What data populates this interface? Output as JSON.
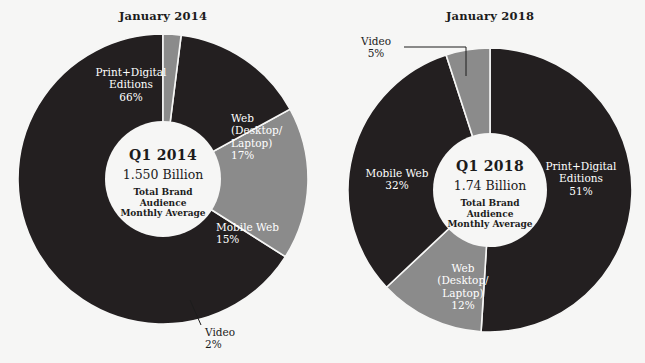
{
  "page": {
    "background_color": "#f6f6f5",
    "dark_color": "#231f20",
    "gray_color": "#8b8b8b",
    "hole_color": "#f6f6f5",
    "text_dark": "#1c1c1c",
    "text_light": "#ffffff"
  },
  "chart_data": [
    {
      "type": "pie",
      "title": "January 2014",
      "center": {
        "quarter": "Q1 2014",
        "value": "1.550 Billion",
        "subtitle": "Total Brand\nAudience\nMonthly Average"
      },
      "categories": [
        "Print+Digital Editions",
        "Web (Desktop/Laptop)",
        "Mobile Web",
        "Video"
      ],
      "values": [
        66,
        17,
        15,
        2
      ],
      "labels": [
        {
          "name": "Print+Digital\nEditions",
          "percent": "66%",
          "color": "#231f20",
          "text_color": "#ffffff"
        },
        {
          "name": "Web\n(Desktop/\nLaptop)",
          "percent": "17%",
          "color": "#8b8b8b",
          "text_color": "#ffffff"
        },
        {
          "name": "Mobile Web",
          "percent": "15%",
          "color": "#231f20",
          "text_color": "#ffffff"
        },
        {
          "name": "Video",
          "percent": "2%",
          "color": "#8b8b8b",
          "text_color": "#1c1c1c"
        }
      ],
      "legend": "none",
      "grid": false
    },
    {
      "type": "pie",
      "title": "January 2018",
      "center": {
        "quarter": "Q1 2018",
        "value": "1.74 Billion",
        "subtitle": "Total Brand\nAudience\nMonthly Average"
      },
      "categories": [
        "Print+Digital Editions",
        "Web (Desktop/Laptop)",
        "Mobile Web",
        "Video"
      ],
      "values": [
        51,
        12,
        32,
        5
      ],
      "labels": [
        {
          "name": "Print+Digital\nEditions",
          "percent": "51%",
          "color": "#231f20",
          "text_color": "#ffffff"
        },
        {
          "name": "Web\n(Desktop/\nLaptop)",
          "percent": "12%",
          "color": "#8b8b8b",
          "text_color": "#ffffff"
        },
        {
          "name": "Mobile Web",
          "percent": "32%",
          "color": "#231f20",
          "text_color": "#ffffff"
        },
        {
          "name": "Video",
          "percent": "5%",
          "color": "#8b8b8b",
          "text_color": "#1c1c1c"
        }
      ],
      "legend": "none",
      "grid": false
    }
  ],
  "left_chart": {
    "title": "January 2014",
    "center_quarter": "Q1 2014",
    "center_value": "1.550 Billion",
    "center_subtitle": "Total Brand\nAudience\nMonthly Average",
    "label_print": "Print+Digital\nEditions\n66%",
    "label_web": "Web\n(Desktop/\nLaptop)\n17%",
    "label_mobile": "Mobile Web\n15%",
    "label_video": "Video\n2%"
  },
  "right_chart": {
    "title": "January 2018",
    "center_quarter": "Q1 2018",
    "center_value": "1.74 Billion",
    "center_subtitle": "Total Brand\nAudience\nMonthly Average",
    "label_print": "Print+Digital\nEditions\n51%",
    "label_web": "Web\n(Desktop/\nLaptop)\n12%",
    "label_mobile": "Mobile Web\n32%",
    "label_video": "Video\n5%"
  }
}
